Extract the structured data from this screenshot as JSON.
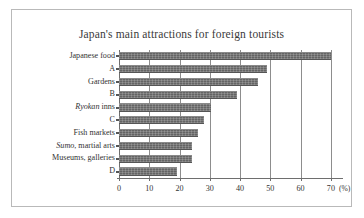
{
  "figure": {
    "title": "Japan's main attractions for foreign tourists",
    "unit_label": "(%)"
  },
  "chart_data": {
    "type": "bar",
    "orientation": "horizontal",
    "title": "Japan's main attractions for foreign tourists",
    "xlabel": "(%)",
    "ylabel": "",
    "xlim": [
      0,
      74
    ],
    "ylim": null,
    "grid": true,
    "legend": false,
    "xticks": [
      0,
      10,
      20,
      30,
      40,
      50,
      60,
      70
    ],
    "xticklabels": [
      "0",
      "10",
      "20",
      "30",
      "40",
      "50",
      "60",
      "70"
    ],
    "categories": [
      "Japanese food",
      "A",
      "Gardens",
      "B",
      "Ryokan inns",
      "C",
      "Fish markets",
      "Sumo, martial arts",
      "Museums, galleries",
      "D"
    ],
    "categories_html": [
      "Japanese food",
      "A",
      "Gardens",
      "B",
      "<span class=\"ital\">Ryokan</span> inns",
      "C",
      "Fish markets",
      "<span class=\"ital\">Sumo</span>, martial arts",
      "Museums, galleries",
      "D"
    ],
    "values": [
      70,
      49,
      46,
      39,
      30.5,
      28,
      26,
      24,
      24,
      19
    ],
    "bar_color": "#6f6f6f"
  }
}
